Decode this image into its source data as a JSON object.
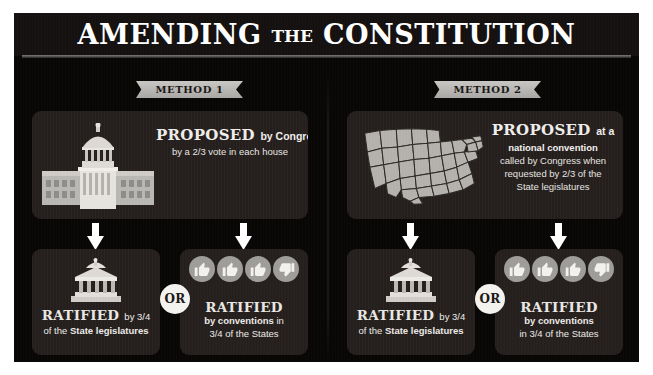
{
  "poster": {
    "title_main_1": "AMENDING",
    "title_small": "THE",
    "title_main_2": "CONSTITUTION",
    "bg_color": "#080706",
    "panel_color": "#241f1d",
    "accent_color": "#a9a7a3"
  },
  "methods": [
    {
      "ribbon_label": "METHOD 1",
      "proposal": {
        "icon": "capitol-building-icon",
        "headline_bold": "PROPOSED",
        "headline_regular": "by Congress",
        "detail_lines": [
          "by a 2/3 vote in each house"
        ]
      },
      "ratify_left": {
        "icon": "statehouse-icon",
        "headline_bold": "RATIFIED",
        "headline_regular": "by 3/4",
        "sub_prefix": "of the ",
        "sub_bold": "State legislatures",
        "sub_suffix": ""
      },
      "connector_label": "OR",
      "ratify_right": {
        "icons": [
          "thumbs-up-icon",
          "thumbs-up-icon",
          "thumbs-up-icon",
          "thumbs-down-icon"
        ],
        "headline_bold": "RATIFIED",
        "sub_line_1_bold": "by conventions",
        "sub_line_1_suffix": " in",
        "sub_line_2": "3/4 of the States"
      }
    },
    {
      "ribbon_label": "METHOD 2",
      "proposal": {
        "icon": "united-states-map-icon",
        "headline_bold": "PROPOSED",
        "headline_regular": "at a",
        "detail_bold": "national convention",
        "detail_lines": [
          "called by Congress when",
          "requested by 2/3 of the",
          "State legislatures"
        ]
      },
      "ratify_left": {
        "icon": "statehouse-icon",
        "headline_bold": "RATIFIED",
        "headline_regular": "by 3/4",
        "sub_prefix": "of the ",
        "sub_bold": "State legislatures",
        "sub_suffix": ""
      },
      "connector_label": "OR",
      "ratify_right": {
        "icons": [
          "thumbs-up-icon",
          "thumbs-up-icon",
          "thumbs-up-icon",
          "thumbs-down-icon"
        ],
        "headline_bold": "RATIFIED",
        "sub_line_1_bold": "by conventions",
        "sub_line_1_suffix": "",
        "sub_line_2": "in 3/4 of the States"
      }
    }
  ]
}
